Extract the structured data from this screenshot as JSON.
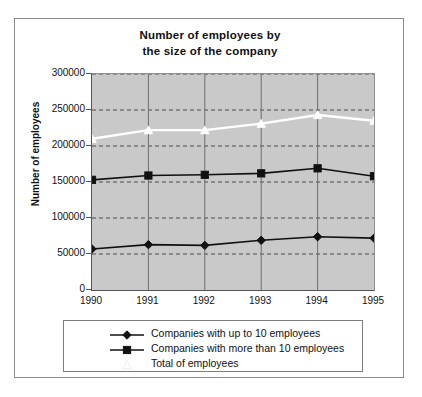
{
  "chart_data": {
    "type": "line",
    "title": "Number of employees by the size of the company",
    "title_lines": [
      "Number of employees by",
      "the size of the company"
    ],
    "xlabel": "",
    "ylabel": "Number of employees",
    "categories": [
      "1990",
      "1991",
      "1992",
      "1993",
      "1994",
      "1995"
    ],
    "x": [
      1990,
      1991,
      1992,
      1993,
      1994,
      1995
    ],
    "ylim": [
      0,
      300000
    ],
    "ytick_labels": [
      "0",
      "50000",
      "100000",
      "150000",
      "200000",
      "250000",
      "300000"
    ],
    "ytick_values": [
      0,
      50000,
      100000,
      150000,
      200000,
      250000,
      300000
    ],
    "grid": "horizontal-dashed-and-vertical-solid",
    "legend_position": "below-plot",
    "plot_background_color": "#c9c9c9",
    "series": [
      {
        "name": "Companies with up to 10 employees",
        "values": [
          57000,
          63000,
          62000,
          69000,
          74000,
          72000
        ],
        "color": "#111111",
        "marker": "diamond",
        "marker_fill": "#111111"
      },
      {
        "name": "Companies with more than 10 employees",
        "values": [
          153000,
          159000,
          160000,
          162000,
          169000,
          158000
        ],
        "color": "#111111",
        "marker": "square",
        "marker_fill": "#111111"
      },
      {
        "name": "Total of employees",
        "values": [
          210000,
          222000,
          222000,
          231000,
          243000,
          235000
        ],
        "color": "#ffffff",
        "marker": "triangle",
        "marker_fill": "#ffffff"
      }
    ]
  },
  "legend": {
    "items": [
      {
        "label": "Companies with up to 10 employees",
        "marker": "diamond",
        "color": "#111111"
      },
      {
        "label": "Companies with more than 10 employees",
        "marker": "square",
        "color": "#111111"
      },
      {
        "label": "Total of employees",
        "marker": "triangle",
        "color": "#ffffff"
      }
    ]
  }
}
